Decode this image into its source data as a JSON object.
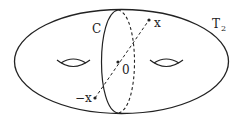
{
  "diagram": {
    "surface_label": "T",
    "surface_subscript": "2",
    "curve_label": "C",
    "point_x_label": "x",
    "point_origin_label": "0",
    "point_neg_x_label": "−x",
    "colors": {
      "stroke": "#222222",
      "background": "#ffffff"
    }
  }
}
